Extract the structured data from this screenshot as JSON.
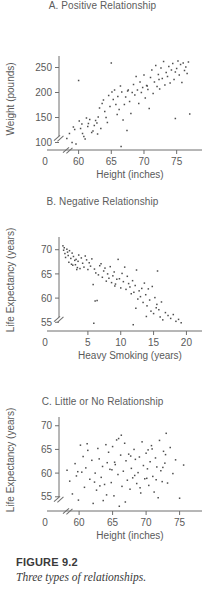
{
  "figure": {
    "number_label": "FIGURE 9.2",
    "caption": "Three types of relationships."
  },
  "axis_style": {
    "line_color": "#6e6e6e",
    "point_color": "#4d4d4d",
    "text_color": "#5a5a5a",
    "break_symbol": "//"
  },
  "chart_data": [
    {
      "id": "panel-a",
      "type": "scatter",
      "title": "A. Positive Relationship",
      "xlabel": "Height (inches)",
      "ylabel": "Weight (pounds)",
      "xticks": [
        60,
        65,
        70,
        75
      ],
      "yticks": [
        100,
        150,
        200,
        250
      ],
      "xlim": [
        57.0,
        77.5
      ],
      "ylim": [
        85,
        265
      ],
      "origin_label": "0",
      "axis_break_x": true,
      "axis_break_y": true,
      "grid": false,
      "legend": "none",
      "x": [
        58.2,
        58.6,
        59.0,
        59.2,
        59.4,
        59.6,
        60.0,
        60.1,
        60.3,
        60.5,
        60.6,
        60.8,
        61.0,
        61.2,
        61.5,
        61.7,
        62.0,
        62.2,
        62.4,
        62.6,
        62.9,
        63.0,
        63.2,
        63.4,
        63.6,
        63.8,
        64.0,
        64.2,
        64.4,
        64.6,
        64.8,
        65.0,
        65.1,
        65.3,
        65.5,
        65.7,
        65.9,
        66.0,
        66.2,
        66.4,
        66.6,
        66.8,
        67.0,
        67.2,
        67.4,
        67.6,
        67.8,
        68.0,
        68.2,
        68.4,
        68.6,
        68.8,
        69.0,
        69.2,
        69.4,
        69.6,
        69.8,
        70.0,
        70.2,
        70.4,
        70.6,
        70.8,
        71.0,
        71.2,
        71.4,
        71.6,
        71.8,
        72.0,
        72.2,
        72.4,
        72.6,
        72.8,
        73.0,
        73.2,
        73.4,
        73.6,
        73.8,
        74.0,
        74.2,
        74.4,
        74.6,
        74.8,
        75.0,
        75.2,
        75.4,
        75.6,
        75.8,
        76.0,
        76.2,
        76.4,
        76.6,
        76.8,
        77.0,
        61.4,
        66.5,
        70.5,
        74.8,
        62.8,
        67.5,
        72.3
      ],
      "y": [
        108,
        118,
        100,
        131,
        126,
        97,
        224,
        143,
        128,
        137,
        118,
        112,
        107,
        149,
        138,
        146,
        120,
        123,
        134,
        144,
        117,
        151,
        169,
        128,
        178,
        185,
        162,
        150,
        140,
        194,
        172,
        259,
        201,
        186,
        205,
        176,
        156,
        192,
        166,
        213,
        201,
        145,
        176,
        191,
        124,
        205,
        182,
        158,
        200,
        216,
        195,
        232,
        205,
        178,
        221,
        200,
        210,
        235,
        189,
        214,
        206,
        168,
        230,
        245,
        198,
        221,
        254,
        212,
        236,
        207,
        249,
        228,
        262,
        215,
        240,
        232,
        252,
        219,
        245,
        258,
        226,
        241,
        248,
        263,
        235,
        256,
        220,
        259,
        244,
        251,
        238,
        261,
        157,
        132,
        92,
        213,
        148,
        139,
        203,
        226
      ]
    },
    {
      "id": "panel-b",
      "type": "scatter",
      "title": "B. Negative Relationship",
      "xlabel": "Heavy Smoking (years)",
      "ylabel": "Life Expectancy (years)",
      "xticks": [
        5,
        10,
        15,
        20
      ],
      "yticks": [
        55,
        60,
        65,
        70
      ],
      "xlim": [
        0.6,
        21.0
      ],
      "ylim": [
        53.2,
        71.8
      ],
      "origin_label": "0",
      "axis_break_x": false,
      "axis_break_y": true,
      "grid": false,
      "legend": "none",
      "x": [
        1.2,
        1.3,
        1.4,
        1.5,
        1.6,
        1.8,
        1.9,
        2.0,
        2.1,
        2.2,
        2.4,
        2.5,
        2.6,
        2.8,
        3.0,
        3.1,
        3.2,
        3.4,
        3.5,
        3.6,
        3.8,
        4.0,
        4.2,
        4.4,
        4.6,
        4.8,
        5.0,
        5.2,
        5.4,
        5.6,
        5.8,
        6.0,
        6.2,
        6.4,
        6.6,
        6.8,
        7.0,
        7.2,
        7.4,
        7.6,
        7.8,
        8.0,
        8.2,
        8.4,
        8.6,
        8.8,
        9.0,
        9.2,
        9.4,
        9.6,
        9.8,
        10.0,
        10.2,
        10.4,
        10.6,
        10.8,
        11.0,
        11.2,
        11.4,
        11.6,
        11.8,
        12.0,
        12.2,
        12.4,
        12.6,
        12.8,
        13.0,
        13.2,
        13.4,
        13.6,
        13.8,
        14.0,
        14.2,
        14.4,
        14.6,
        14.8,
        15.0,
        15.2,
        15.4,
        15.6,
        15.8,
        16.0,
        16.2,
        16.4,
        16.8,
        17.2,
        17.6,
        18.0,
        18.4,
        18.8,
        19.2,
        2.7,
        3.3,
        5.9,
        11.9,
        12.3,
        6.1,
        9.1,
        13.9,
        15.5
      ],
      "y": [
        70.8,
        69.9,
        70.4,
        69.2,
        68.4,
        70.1,
        69.5,
        68.8,
        67.4,
        69.8,
        68.2,
        67.0,
        69.3,
        68.6,
        67.8,
        66.9,
        68.0,
        66.3,
        67.6,
        68.9,
        66.1,
        68.3,
        67.2,
        66.4,
        68.7,
        67.9,
        65.9,
        67.3,
        66.6,
        68.1,
        62.8,
        66.0,
        65.2,
        59.5,
        64.8,
        66.7,
        67.1,
        64.3,
        65.6,
        66.2,
        63.5,
        65.0,
        64.1,
        66.5,
        63.2,
        64.6,
        65.4,
        62.9,
        63.9,
        68.0,
        64.0,
        62.1,
        65.1,
        63.4,
        66.4,
        61.8,
        64.5,
        63.0,
        62.3,
        60.9,
        63.6,
        61.2,
        62.6,
        65.8,
        59.8,
        61.5,
        60.3,
        62.0,
        59.1,
        63.1,
        60.7,
        58.4,
        61.9,
        59.6,
        57.3,
        62.4,
        56.8,
        60.1,
        58.0,
        65.6,
        57.6,
        56.1,
        59.2,
        55.5,
        57.0,
        56.4,
        55.8,
        56.6,
        55.2,
        55.6,
        54.9,
        66.8,
        65.9,
        54.8,
        54.5,
        57.9,
        59.4,
        62.5,
        56.2,
        58.7
      ]
    },
    {
      "id": "panel-c",
      "type": "scatter",
      "title": "C. Little or No Relationship",
      "xlabel": "Height (inches)",
      "ylabel": "Life Expectancy (years)",
      "xticks": [
        60,
        65,
        70,
        75
      ],
      "yticks": [
        55,
        60,
        65,
        70
      ],
      "xlim": [
        57.0,
        77.0
      ],
      "ylim": [
        52.0,
        71.0
      ],
      "origin_label": "0",
      "axis_break_x": true,
      "axis_break_y": true,
      "grid": false,
      "legend": "none",
      "x": [
        58.2,
        58.6,
        59.0,
        59.4,
        59.6,
        59.9,
        60.2,
        60.4,
        60.6,
        60.8,
        61.0,
        61.3,
        61.6,
        61.9,
        62.1,
        62.4,
        62.6,
        62.8,
        63.0,
        63.3,
        63.5,
        63.8,
        64.0,
        64.2,
        64.4,
        64.6,
        64.8,
        65.0,
        65.2,
        65.4,
        65.6,
        65.8,
        66.0,
        66.2,
        66.4,
        66.6,
        66.8,
        67.0,
        67.2,
        67.4,
        67.6,
        67.8,
        68.0,
        68.2,
        68.4,
        68.6,
        68.8,
        69.0,
        69.2,
        69.4,
        69.6,
        69.8,
        70.0,
        70.2,
        70.4,
        70.6,
        70.8,
        71.0,
        71.2,
        71.4,
        71.6,
        71.8,
        72.0,
        72.2,
        72.4,
        72.6,
        72.8,
        73.0,
        73.2,
        73.6,
        74.0,
        74.4,
        75.0,
        75.6,
        61.2,
        62.3,
        63.6,
        64.9,
        66.3,
        67.7,
        69.1,
        70.3,
        71.5,
        72.5,
        64.1,
        65.9,
        68.3,
        70.9,
        66.9,
        63.1,
        59.8,
        65.3,
        72.9,
        70.1
      ],
      "y": [
        60.6,
        58.3,
        55.6,
        62.0,
        59.4,
        54.3,
        65.9,
        60.2,
        63.5,
        57.0,
        61.1,
        64.8,
        58.7,
        62.7,
        53.6,
        60.0,
        56.4,
        65.2,
        63.0,
        59.1,
        61.4,
        57.6,
        66.0,
        62.2,
        64.4,
        60.8,
        58.0,
        65.6,
        55.2,
        61.8,
        67.0,
        59.7,
        53.0,
        63.8,
        57.2,
        60.4,
        66.3,
        62.6,
        58.5,
        64.0,
        56.6,
        61.0,
        59.0,
        65.0,
        62.9,
        57.8,
        60.1,
        63.4,
        55.8,
        66.6,
        61.6,
        58.8,
        64.2,
        60.9,
        57.4,
        62.4,
        65.8,
        59.3,
        56.0,
        63.2,
        61.3,
        54.8,
        66.9,
        60.5,
        58.2,
        64.6,
        62.1,
        68.4,
        57.9,
        65.4,
        59.9,
        62.8,
        54.7,
        61.7,
        66.2,
        58.1,
        54.2,
        60.7,
        68.0,
        63.6,
        56.9,
        64.9,
        58.6,
        61.2,
        55.4,
        67.3,
        59.5,
        65.1,
        53.9,
        57.3,
        60.3,
        62.3,
        63.9,
        58.9
      ]
    }
  ]
}
